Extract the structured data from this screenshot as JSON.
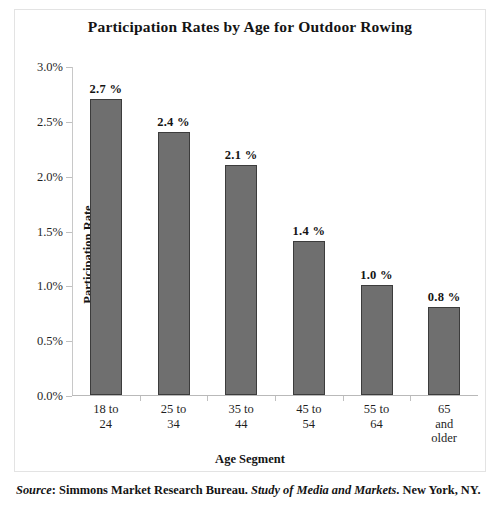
{
  "chart_data": {
    "type": "bar",
    "title": "Participation Rates by Age for Outdoor Rowing",
    "xlabel": "Age Segment",
    "ylabel": "Participation Rate",
    "categories": [
      "18 to\n24",
      "25 to\n34",
      "35 to\n44",
      "45 to\n54",
      "55 to\n64",
      "65\nand\nolder"
    ],
    "values": [
      2.7,
      2.4,
      2.1,
      1.4,
      1.0,
      0.8
    ],
    "data_labels": [
      "2.7 %",
      "2.4 %",
      "2.1 %",
      "1.4 %",
      "1.0 %",
      "0.8 %"
    ],
    "ylim": [
      0.0,
      3.0
    ],
    "ytick_values": [
      0.0,
      0.5,
      1.0,
      1.5,
      2.0,
      2.5,
      3.0
    ],
    "ytick_labels": [
      "0.0%",
      "0.5%",
      "1.0%",
      "1.5%",
      "2.0%",
      "2.5%",
      "3.0%"
    ],
    "grid": false,
    "legend": "none",
    "bar_color": "#6f6f6f",
    "bar_border_color": "#3c3c3c",
    "axis_color": "#c0c0c0"
  },
  "source": {
    "label": "Source",
    "colon": ": ",
    "publisher": "Simmons Market Research Bureau. ",
    "work": "Study of Media and Markets",
    "location": ". New York, NY."
  }
}
